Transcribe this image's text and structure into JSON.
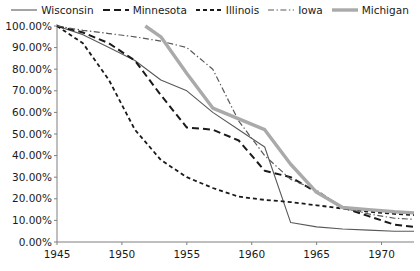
{
  "chart_data": {
    "type": "line",
    "title": "",
    "subtitle": "",
    "xlabel": "",
    "ylabel": "",
    "xlim": [
      1945,
      1972.5
    ],
    "ylim": [
      0,
      1
    ],
    "grid": false,
    "legend_position": "top-center",
    "x_ticks": [
      "1945",
      "1950",
      "1955",
      "1960",
      "1965",
      "1970"
    ],
    "x_tick_values": [
      1945,
      1950,
      1955,
      1960,
      1965,
      1970
    ],
    "y_ticks": [
      "0.00%",
      "10.00%",
      "20.00%",
      "30.00%",
      "40.00%",
      "50.00%",
      "60.00%",
      "70.00%",
      "80.00%",
      "90.00%",
      "100.00%"
    ],
    "y_tick_values": [
      0,
      10,
      20,
      30,
      40,
      50,
      60,
      70,
      80,
      90,
      100
    ],
    "series": [
      {
        "name": "Wisconsin",
        "style": "solid",
        "color": "#595959",
        "width": 1.1,
        "x": [
          1945,
          1947,
          1949,
          1951,
          1953,
          1955,
          1957,
          1959,
          1961,
          1963,
          1965,
          1967,
          1969,
          1971,
          1972.5
        ],
        "values": [
          100.0,
          96.0,
          90.0,
          84.0,
          75.0,
          70.0,
          60.0,
          52.0,
          44.0,
          9.0,
          7.0,
          6.0,
          5.5,
          5.0,
          5.0
        ]
      },
      {
        "name": "Minnesota",
        "style": "dashed",
        "color": "#1a1a1a",
        "width": 2.0,
        "x": [
          1945,
          1947,
          1949,
          1951,
          1953,
          1955,
          1957,
          1959,
          1961,
          1963,
          1965,
          1967,
          1969,
          1971,
          1972.5
        ],
        "values": [
          100.0,
          97.0,
          92.0,
          84.0,
          68.0,
          53.0,
          52.0,
          47.0,
          33.0,
          30.0,
          23.0,
          16.0,
          12.0,
          8.0,
          7.0
        ]
      },
      {
        "name": "Illinois",
        "style": "short-dashed",
        "color": "#1a1a1a",
        "width": 1.8,
        "x": [
          1945,
          1947,
          1949,
          1951,
          1953,
          1955,
          1957,
          1959,
          1961,
          1963,
          1965,
          1967,
          1969,
          1971,
          1972.5
        ],
        "values": [
          100.0,
          92.0,
          75.0,
          52.0,
          38.0,
          30.0,
          25.0,
          21.0,
          19.5,
          18.5,
          17.0,
          15.5,
          14.0,
          13.0,
          12.5
        ]
      },
      {
        "name": "Iowa",
        "style": "dash-dot",
        "color": "#595959",
        "width": 1.2,
        "x": [
          1945,
          1947,
          1949,
          1951,
          1953,
          1955,
          1957,
          1959,
          1961,
          1963,
          1965,
          1967,
          1969,
          1971,
          1972.5
        ],
        "values": [
          100.0,
          98.0,
          96.5,
          95.0,
          93.0,
          90.0,
          80.0,
          56.0,
          40.0,
          29.0,
          24.0,
          16.0,
          13.0,
          11.0,
          10.5
        ]
      },
      {
        "name": "Michigan",
        "style": "solid-thick",
        "color": "#aaaaaa",
        "width": 3.4,
        "x": [
          1951.8,
          1953,
          1955,
          1957,
          1959,
          1961,
          1963,
          1965,
          1967,
          1969,
          1971,
          1972.5
        ],
        "values": [
          100.0,
          95.0,
          78.0,
          62.0,
          57.0,
          52.0,
          36.0,
          23.0,
          16.0,
          15.0,
          14.0,
          13.5
        ]
      }
    ]
  },
  "legend": {
    "items": [
      {
        "label": "Wisconsin",
        "swatch": "solid-line-swatch"
      },
      {
        "label": "Minnesota",
        "swatch": "dashed-line-swatch"
      },
      {
        "label": "Illinois",
        "swatch": "short-dashed-line-swatch"
      },
      {
        "label": "Iowa",
        "swatch": "dash-dot-line-swatch"
      },
      {
        "label": "Michigan",
        "swatch": "thick-solid-line-swatch"
      }
    ]
  },
  "axes": {
    "axis_color": "#7f7f7f",
    "tick_color": "#7f7f7f",
    "label_color": "#1a1a1a"
  }
}
